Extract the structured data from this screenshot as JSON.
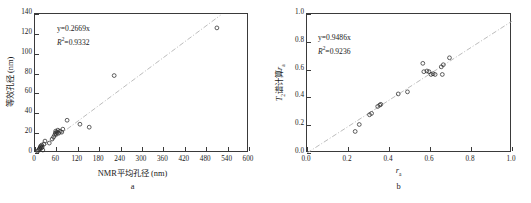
{
  "figure": {
    "background": "#ffffff",
    "marker_color": "#2b2b2b",
    "trend_color": "#b4b4b4",
    "axis_color": "#3a3a3a"
  },
  "panels": [
    {
      "caption": "a",
      "xtitle": "NMR平均孔径 (nm)",
      "ytitle": "等效孔径 (nm)",
      "equation": "y=0.2669x",
      "r2_prefix": "R",
      "r2_sup": "2",
      "r2_value": "=0.9332",
      "xticks": [
        "0",
        "60",
        "120",
        "180",
        "240",
        "300",
        "360",
        "420",
        "480",
        "540",
        "600"
      ],
      "yticks": [
        "0",
        "20",
        "40",
        "60",
        "80",
        "100",
        "120",
        "140"
      ]
    },
    {
      "caption": "b",
      "xtitle_main": "r",
      "xtitle_sub": "a",
      "ytitle_pre": "T",
      "ytitle_sub1": "2",
      "ytitle_mid": "谱计算",
      "ytitle_var": "r",
      "ytitle_sub2": "a",
      "equation": "y=0.9486x",
      "r2_prefix": "R",
      "r2_sup": "2",
      "r2_value": "=0.9236",
      "xticks": [
        "0.0",
        "0.2",
        "0.4",
        "0.6",
        "0.8",
        "1.0"
      ],
      "yticks": [
        "0.0",
        "0.2",
        "0.4",
        "0.6",
        "0.8",
        "1.0"
      ]
    }
  ],
  "chart_data": [
    {
      "type": "scatter",
      "panel": "a",
      "title": "",
      "xlabel": "NMR平均孔径 (nm)",
      "ylabel": "等效孔径 (nm)",
      "xlim": [
        0,
        600
      ],
      "ylim": [
        0,
        140
      ],
      "xticks": [
        0,
        60,
        120,
        180,
        240,
        300,
        360,
        420,
        480,
        540,
        600
      ],
      "yticks": [
        0,
        20,
        40,
        60,
        80,
        100,
        120,
        140
      ],
      "grid": false,
      "legend": "none",
      "annotations": [
        "y=0.2669x",
        "R2=0.9332"
      ],
      "fit": {
        "type": "line",
        "equation": "y=0.2669x",
        "slope": 0.2669,
        "intercept": 0,
        "r_squared": 0.9332,
        "style": "dash-dot",
        "color": "#b4b4b4",
        "x_range": [
          0,
          520
        ]
      },
      "points": [
        {
          "x": 8,
          "y": 2
        },
        {
          "x": 10,
          "y": 3
        },
        {
          "x": 12,
          "y": 4
        },
        {
          "x": 14,
          "y": 5
        },
        {
          "x": 15,
          "y": 6
        },
        {
          "x": 16,
          "y": 7
        },
        {
          "x": 18,
          "y": 5
        },
        {
          "x": 19,
          "y": 8
        },
        {
          "x": 20,
          "y": 6
        },
        {
          "x": 22,
          "y": 3
        },
        {
          "x": 25,
          "y": 9
        },
        {
          "x": 28,
          "y": 12
        },
        {
          "x": 40,
          "y": 10
        },
        {
          "x": 48,
          "y": 14
        },
        {
          "x": 52,
          "y": 16
        },
        {
          "x": 55,
          "y": 18
        },
        {
          "x": 57,
          "y": 20
        },
        {
          "x": 58,
          "y": 22
        },
        {
          "x": 60,
          "y": 19
        },
        {
          "x": 62,
          "y": 21
        },
        {
          "x": 64,
          "y": 23
        },
        {
          "x": 66,
          "y": 20
        },
        {
          "x": 70,
          "y": 22
        },
        {
          "x": 75,
          "y": 21
        },
        {
          "x": 78,
          "y": 24
        },
        {
          "x": 90,
          "y": 33
        },
        {
          "x": 126,
          "y": 29
        },
        {
          "x": 152,
          "y": 26
        },
        {
          "x": 222,
          "y": 78
        },
        {
          "x": 510,
          "y": 126
        }
      ]
    },
    {
      "type": "scatter",
      "panel": "b",
      "title": "",
      "xlabel": "ra",
      "ylabel": "T2谱计算 ra",
      "xlim": [
        0.0,
        1.0
      ],
      "ylim": [
        0.0,
        1.0
      ],
      "xticks": [
        0.0,
        0.2,
        0.4,
        0.6,
        0.8,
        1.0
      ],
      "yticks": [
        0.0,
        0.2,
        0.4,
        0.6,
        0.8,
        1.0
      ],
      "grid": false,
      "legend": "none",
      "annotations": [
        "y=0.9486x",
        "R2=0.9236"
      ],
      "fit": {
        "type": "line",
        "equation": "y=0.9486x",
        "slope": 0.9486,
        "intercept": 0,
        "r_squared": 0.9236,
        "style": "dash-dot",
        "color": "#b4b4b4",
        "x_range": [
          0.0,
          1.0
        ]
      },
      "points": [
        {
          "x": 0.235,
          "y": 0.155
        },
        {
          "x": 0.255,
          "y": 0.205
        },
        {
          "x": 0.305,
          "y": 0.275
        },
        {
          "x": 0.315,
          "y": 0.285
        },
        {
          "x": 0.345,
          "y": 0.335
        },
        {
          "x": 0.355,
          "y": 0.345
        },
        {
          "x": 0.36,
          "y": 0.35
        },
        {
          "x": 0.445,
          "y": 0.425
        },
        {
          "x": 0.49,
          "y": 0.44
        },
        {
          "x": 0.565,
          "y": 0.645
        },
        {
          "x": 0.57,
          "y": 0.585
        },
        {
          "x": 0.585,
          "y": 0.59
        },
        {
          "x": 0.595,
          "y": 0.585
        },
        {
          "x": 0.605,
          "y": 0.565
        },
        {
          "x": 0.615,
          "y": 0.57
        },
        {
          "x": 0.625,
          "y": 0.565
        },
        {
          "x": 0.655,
          "y": 0.62
        },
        {
          "x": 0.66,
          "y": 0.565
        },
        {
          "x": 0.665,
          "y": 0.635
        },
        {
          "x": 0.695,
          "y": 0.685
        }
      ]
    }
  ]
}
